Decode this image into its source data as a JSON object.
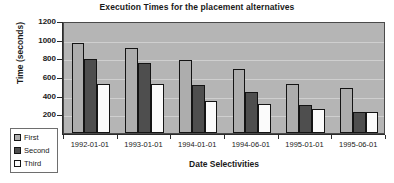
{
  "chart_data": {
    "type": "bar",
    "title": "Execution Times for the placement alternatives",
    "xlabel": "Date Selectivities",
    "ylabel": "Time (seconds)",
    "categories": [
      "1992-01-01",
      "1993-01-01",
      "1994-01-01",
      "1994-06-01",
      "1995-01-01",
      "1995-06-01"
    ],
    "series": [
      {
        "name": "First",
        "color": "#adadad",
        "values": [
          965,
          915,
          780,
          690,
          520,
          485
        ]
      },
      {
        "name": "Second",
        "color": "#4e4e4e",
        "values": [
          790,
          755,
          515,
          435,
          300,
          230
        ]
      },
      {
        "name": "Third",
        "color": "#fbfbfb",
        "values": [
          530,
          525,
          345,
          315,
          255,
          220
        ]
      }
    ],
    "ylim": [
      0,
      1200
    ],
    "yticks": [
      200,
      400,
      600,
      800,
      1000,
      1200
    ],
    "ytick_labels": [
      "200",
      "400",
      "600",
      "800",
      "1000",
      "1200"
    ],
    "grid": true,
    "grid_axis": "y",
    "legend_position": "lower-left-outside",
    "plot_background": "#b5b5b5",
    "gridline_color": "#cfcfcf",
    "axis_color": "#2b2b2b",
    "bar_border_color": "#141414"
  }
}
